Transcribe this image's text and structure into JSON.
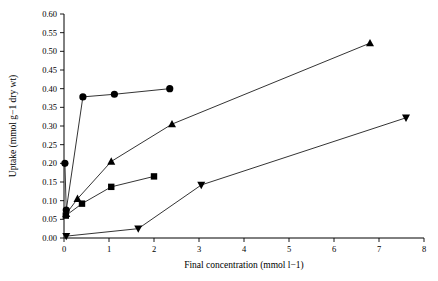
{
  "chart_data": {
    "type": "scatter",
    "title": "",
    "xlabel": "Final concentration (mmol l−1)",
    "ylabel": "Uptake (mmol g−1 dry wt)",
    "xlim": [
      0,
      8
    ],
    "ylim": [
      0,
      0.6
    ],
    "grid": false,
    "legend": "none",
    "xticks": [
      "0",
      "1",
      "2",
      "3",
      "4",
      "5",
      "6",
      "7",
      "8"
    ],
    "yticks": [
      "0.00",
      "0.05",
      "0.10",
      "0.15",
      "0.20",
      "0.25",
      "0.30",
      "0.35",
      "0.40",
      "0.45",
      "0.50",
      "0.55",
      "0.60"
    ],
    "series": [
      {
        "name": "circle-series",
        "marker": "circle",
        "points": [
          {
            "x": 0.02,
            "y": 0.2
          },
          {
            "x": 0.05,
            "y": 0.075
          },
          {
            "x": 0.42,
            "y": 0.378
          },
          {
            "x": 1.12,
            "y": 0.385
          },
          {
            "x": 2.35,
            "y": 0.4
          }
        ]
      },
      {
        "name": "triangle-up-series",
        "marker": "triangle-up",
        "points": [
          {
            "x": 0.05,
            "y": 0.065
          },
          {
            "x": 0.3,
            "y": 0.105
          },
          {
            "x": 1.05,
            "y": 0.205
          },
          {
            "x": 2.4,
            "y": 0.305
          },
          {
            "x": 6.8,
            "y": 0.522
          }
        ]
      },
      {
        "name": "square-series",
        "marker": "square",
        "points": [
          {
            "x": 0.04,
            "y": 0.06
          },
          {
            "x": 0.4,
            "y": 0.092
          },
          {
            "x": 1.05,
            "y": 0.137
          },
          {
            "x": 2.0,
            "y": 0.165
          }
        ]
      },
      {
        "name": "triangle-down-series",
        "marker": "triangle-down",
        "points": [
          {
            "x": 0.05,
            "y": 0.005
          },
          {
            "x": 1.65,
            "y": 0.025
          },
          {
            "x": 3.05,
            "y": 0.142
          },
          {
            "x": 7.6,
            "y": 0.322
          }
        ]
      }
    ]
  }
}
